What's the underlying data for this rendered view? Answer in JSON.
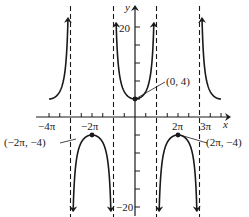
{
  "chart_data": {
    "type": "line",
    "title": "",
    "function": "y = 4 sec(x/2)",
    "xlabel": "x",
    "ylabel": "y",
    "xlim_pi": [
      -4,
      4
    ],
    "ylim": [
      -20,
      20
    ],
    "grid": false,
    "x_tick_labels": [
      "−4π",
      "−2π",
      "2π",
      "3π"
    ],
    "x_tick_values_pi": [
      -4,
      -2,
      2,
      3
    ],
    "x_tick_spacing_pi": 0.5,
    "y_tick_labels": [
      "20",
      "−20"
    ],
    "y_tick_values": [
      20,
      -20
    ],
    "y_tick_spacing": 4,
    "asymptotes_pi": [
      -3,
      -1,
      1,
      3
    ],
    "points": [
      {
        "label": "(0, 4)",
        "x_pi": 0,
        "y": 4
      },
      {
        "label": "(−2π, −4)",
        "x_pi": -2,
        "y": -4
      },
      {
        "label": "(2π, −4)",
        "x_pi": 2,
        "y": -4
      }
    ],
    "branches": [
      {
        "x_range_pi": [
          -4,
          -3
        ],
        "direction": "up"
      },
      {
        "x_range_pi": [
          -3,
          -1
        ],
        "direction": "down"
      },
      {
        "x_range_pi": [
          -1,
          1
        ],
        "direction": "up"
      },
      {
        "x_range_pi": [
          1,
          3
        ],
        "direction": "down"
      },
      {
        "x_range_pi": [
          3,
          4
        ],
        "direction": "up"
      }
    ]
  },
  "labels": {
    "x_axis": "x",
    "y_axis": "y",
    "tick_neg4pi": "−4π",
    "tick_neg2pi": "−2π",
    "tick_2pi": "2π",
    "tick_3pi": "3π",
    "tick_20": "20",
    "tick_neg20": "−20",
    "point_0_4": "(0, 4)",
    "point_neg2pi": "(−2π, −4)",
    "point_2pi": "(2π, −4)"
  }
}
